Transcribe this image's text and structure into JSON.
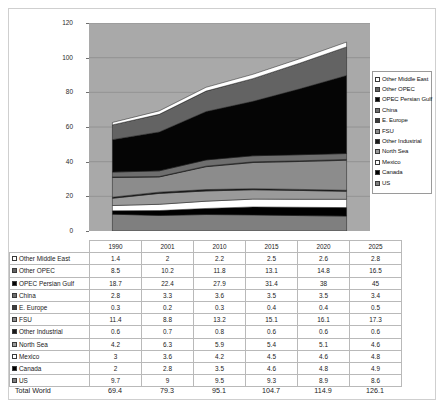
{
  "chart_data": {
    "type": "area",
    "title": "",
    "xlabel": "",
    "ylabel": "",
    "ylim": [
      0,
      120
    ],
    "yticks": [
      0,
      20,
      40,
      60,
      80,
      100,
      120
    ],
    "grid": true,
    "legend_position": "right",
    "stacked": true,
    "categories": [
      "1990",
      "2001",
      "2010",
      "2015",
      "2020",
      "2025"
    ],
    "series": [
      {
        "name": "US",
        "values": [
          9.7,
          9,
          9.5,
          9.3,
          8.9,
          8.6
        ],
        "color": "#7f7f7f"
      },
      {
        "name": "Canada",
        "values": [
          2,
          2.8,
          3.5,
          4.6,
          4.8,
          4.9
        ],
        "color": "#000000"
      },
      {
        "name": "Mexico",
        "values": [
          3,
          3.6,
          4.2,
          4.5,
          4.6,
          4.8
        ],
        "color": "#ffffff"
      },
      {
        "name": "North Sea",
        "values": [
          4.2,
          6.3,
          5.9,
          5.4,
          5.1,
          4.6
        ],
        "color": "#9a9a9a"
      },
      {
        "name": "Other Industrial",
        "values": [
          0.6,
          0.7,
          0.8,
          0.6,
          0.6,
          0.6
        ],
        "color": "#1a1a1a"
      },
      {
        "name": "FSU",
        "values": [
          11.4,
          8.8,
          13.2,
          15.1,
          16.1,
          17.3
        ],
        "color": "#8c8c8c"
      },
      {
        "name": "E. Europe",
        "values": [
          0.3,
          0.2,
          0.3,
          0.4,
          0.4,
          0.5
        ],
        "color": "#3d3d3d"
      },
      {
        "name": "China",
        "values": [
          2.8,
          3.3,
          3.6,
          3.5,
          3.5,
          3.4
        ],
        "color": "#6e6e6e"
      },
      {
        "name": "OPEC Persian Gulf",
        "values": [
          18.7,
          22.4,
          27.9,
          31.4,
          38,
          45
        ],
        "color": "#050505"
      },
      {
        "name": "Other OPEC",
        "values": [
          8.5,
          10.2,
          11.8,
          13.1,
          14.8,
          16.5
        ],
        "color": "#636363"
      },
      {
        "name": "Other Middle East",
        "values": [
          1.4,
          2,
          2.2,
          2.5,
          2.6,
          2.8
        ],
        "color": "#ffffff"
      }
    ],
    "totals": [
      69.4,
      79.3,
      95.1,
      104.7,
      114.9,
      126.1
    ]
  },
  "legend": {
    "items": [
      {
        "label": "Other Middle East",
        "color": "#ffffff"
      },
      {
        "label": "Other OPEC",
        "color": "#636363"
      },
      {
        "label": "OPEC Persian Gulf",
        "color": "#050505"
      },
      {
        "label": "China",
        "color": "#6e6e6e"
      },
      {
        "label": "E. Europe",
        "color": "#3d3d3d"
      },
      {
        "label": "FSU",
        "color": "#8c8c8c"
      },
      {
        "label": "Other Industrial",
        "color": "#1a1a1a"
      },
      {
        "label": "North Sea",
        "color": "#9a9a9a"
      },
      {
        "label": "Mexico",
        "color": "#ffffff"
      },
      {
        "label": "Canada",
        "color": "#000000"
      },
      {
        "label": "US",
        "color": "#7f7f7f"
      }
    ]
  },
  "table": {
    "corner_label": "",
    "columns": [
      "1990",
      "2001",
      "2010",
      "2015",
      "2020",
      "2025"
    ],
    "rows": [
      {
        "label": "Other Middle East",
        "color": "#ffffff",
        "values": [
          "1.4",
          "2",
          "2.2",
          "2.5",
          "2.6",
          "2.8"
        ]
      },
      {
        "label": "Other OPEC",
        "color": "#636363",
        "values": [
          "8.5",
          "10.2",
          "11.8",
          "13.1",
          "14.8",
          "16.5"
        ]
      },
      {
        "label": "OPEC Persian Gulf",
        "color": "#050505",
        "values": [
          "18.7",
          "22.4",
          "27.9",
          "31.4",
          "38",
          "45"
        ]
      },
      {
        "label": "China",
        "color": "#6e6e6e",
        "values": [
          "2.8",
          "3.3",
          "3.6",
          "3.5",
          "3.5",
          "3.4"
        ]
      },
      {
        "label": "E. Europe",
        "color": "#3d3d3d",
        "values": [
          "0.3",
          "0.2",
          "0.3",
          "0.4",
          "0.4",
          "0.5"
        ]
      },
      {
        "label": "FSU",
        "color": "#8c8c8c",
        "values": [
          "11.4",
          "8.8",
          "13.2",
          "15.1",
          "16.1",
          "17.3"
        ]
      },
      {
        "label": "Other Industrial",
        "color": "#1a1a1a",
        "values": [
          "0.6",
          "0.7",
          "0.8",
          "0.6",
          "0.6",
          "0.6"
        ]
      },
      {
        "label": "North Sea",
        "color": "#9a9a9a",
        "values": [
          "4.2",
          "6.3",
          "5.9",
          "5.4",
          "5.1",
          "4.6"
        ]
      },
      {
        "label": "Mexico",
        "color": "#ffffff",
        "values": [
          "3",
          "3.6",
          "4.2",
          "4.5",
          "4.6",
          "4.8"
        ]
      },
      {
        "label": "Canada",
        "color": "#000000",
        "values": [
          "2",
          "2.8",
          "3.5",
          "4.6",
          "4.8",
          "4.9"
        ]
      },
      {
        "label": "US",
        "color": "#7f7f7f",
        "values": [
          "9.7",
          "9",
          "9.5",
          "9.3",
          "8.9",
          "8.6"
        ]
      }
    ]
  },
  "total_row": {
    "label": "Total World",
    "values": [
      "69.4",
      "79.3",
      "95.1",
      "104.7",
      "114.9",
      "126.1"
    ]
  }
}
